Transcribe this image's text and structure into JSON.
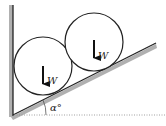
{
  "diagram": {
    "title": "",
    "labels": {
      "weight_left": "W",
      "weight_right": "W",
      "angle": "α°"
    },
    "elements": {
      "wall": {
        "x": 13,
        "y_top": 5,
        "y_bottom": 115
      },
      "incline": {
        "x1": 13,
        "y1": 115,
        "x2": 156,
        "y2": 43
      },
      "baseline": {
        "y": 115,
        "style": "dotted"
      },
      "circles": [
        {
          "cx": 43,
          "cy": 66,
          "r": 29
        },
        {
          "cx": 94,
          "cy": 42,
          "r": 29
        }
      ]
    },
    "colors": {
      "stroke": "#222222",
      "shadow": "#b0b0b0",
      "background": "#ffffff"
    }
  }
}
